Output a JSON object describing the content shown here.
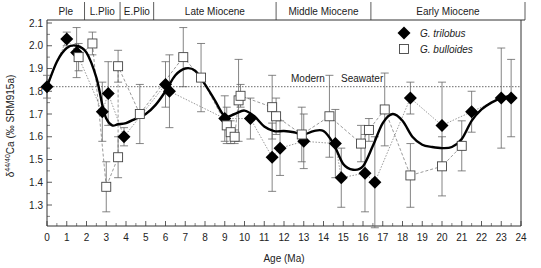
{
  "chart_data": {
    "type": "scatter",
    "title": "",
    "xlabel": "Age (Ma)",
    "ylabel": "δ44/40Ca (‰ SRM915a)",
    "ylabel_parts": {
      "delta": "δ",
      "sup": "44/40",
      "rest": "Ca (‰ SRM915a)"
    },
    "xlim": [
      0,
      24
    ],
    "ylim": [
      1.2,
      2.1
    ],
    "x_ticks": [
      0,
      1,
      2,
      3,
      4,
      5,
      6,
      7,
      8,
      9,
      10,
      11,
      12,
      13,
      14,
      15,
      16,
      17,
      18,
      19,
      20,
      21,
      22,
      23,
      24
    ],
    "y_ticks": [
      1.3,
      1.4,
      1.5,
      1.6,
      1.7,
      1.8,
      1.9,
      2.0,
      2.1
    ],
    "y_tick_labels": [
      "1.3",
      "1.4",
      "1.5",
      "1.6",
      "1.7",
      "1.8",
      "1.9",
      "2.0",
      "2.1"
    ],
    "grid": false,
    "legend_position": "upper right",
    "reference_line": {
      "y": 1.82,
      "label_parts": [
        "Modern",
        "Seawater"
      ],
      "style": "dotted"
    },
    "epochs": [
      {
        "label": "Ple",
        "start": 0,
        "end": 1.9
      },
      {
        "label": "L.Plio",
        "start": 1.9,
        "end": 3.7
      },
      {
        "label": "E.Plio",
        "start": 3.7,
        "end": 5.4
      },
      {
        "label": "Late Miocene",
        "start": 5.4,
        "end": 11.6
      },
      {
        "label": "Middle Miocene",
        "start": 11.6,
        "end": 16.4
      },
      {
        "label": "Early Miocene",
        "start": 16.4,
        "end": 24.2
      }
    ],
    "series": [
      {
        "name": "G. trilobus",
        "marker": "filled-diamond",
        "connector": "dotted",
        "points": [
          {
            "x": 0.0,
            "y": 1.82,
            "err": 0.05
          },
          {
            "x": 1.0,
            "y": 2.03,
            "err": 0.03
          },
          {
            "x": 1.5,
            "y": 1.97,
            "err": 0.11
          },
          {
            "x": 2.8,
            "y": 1.71,
            "err": 0.13
          },
          {
            "x": 3.1,
            "y": 1.79,
            "err": 0.14
          },
          {
            "x": 3.9,
            "y": 1.6,
            "err": 0.04
          },
          {
            "x": 6.0,
            "y": 1.83,
            "err": 0.1
          },
          {
            "x": 6.2,
            "y": 1.8,
            "err": 0.16
          },
          {
            "x": 9.0,
            "y": 1.68,
            "err": 0.1
          },
          {
            "x": 10.3,
            "y": 1.68,
            "err": 0.09
          },
          {
            "x": 11.4,
            "y": 1.51,
            "err": 0.15
          },
          {
            "x": 11.8,
            "y": 1.55,
            "err": 0.12
          },
          {
            "x": 13.0,
            "y": 1.58,
            "err": 0.12
          },
          {
            "x": 14.6,
            "y": 1.57,
            "err": 0.15
          },
          {
            "x": 14.9,
            "y": 1.42,
            "err": 0.13
          },
          {
            "x": 16.1,
            "y": 1.44,
            "err": 0.17
          },
          {
            "x": 16.6,
            "y": 1.4,
            "err": 0.2
          },
          {
            "x": 18.4,
            "y": 1.77,
            "err": 0.07
          },
          {
            "x": 20.0,
            "y": 1.65,
            "err": 0.19
          },
          {
            "x": 21.5,
            "y": 1.71,
            "err": 0.09
          },
          {
            "x": 23.0,
            "y": 1.77,
            "err": 0.22
          },
          {
            "x": 23.5,
            "y": 1.77,
            "err": 0.17
          }
        ]
      },
      {
        "name": "G. bulloides",
        "marker": "open-square",
        "connector": "dashed",
        "points": [
          {
            "x": 1.6,
            "y": 1.95,
            "err": 0.06
          },
          {
            "x": 2.3,
            "y": 2.01,
            "err": 0.05
          },
          {
            "x": 3.0,
            "y": 1.38,
            "err": 0.11
          },
          {
            "x": 3.6,
            "y": 1.51,
            "err": 0.09
          },
          {
            "x": 3.6,
            "y": 1.91,
            "err": 0.07
          },
          {
            "x": 4.7,
            "y": 1.7,
            "err": 0.13
          },
          {
            "x": 6.9,
            "y": 1.95,
            "err": 0.13
          },
          {
            "x": 7.8,
            "y": 1.86,
            "err": 0.15
          },
          {
            "x": 9.1,
            "y": 1.65,
            "err": 0.08
          },
          {
            "x": 9.3,
            "y": 1.62,
            "err": 0.05
          },
          {
            "x": 9.5,
            "y": 1.6,
            "err": 0.03
          },
          {
            "x": 9.7,
            "y": 1.76,
            "err": 0.18
          },
          {
            "x": 9.8,
            "y": 1.78,
            "err": 0.05
          },
          {
            "x": 11.4,
            "y": 1.73,
            "err": 0.14
          },
          {
            "x": 11.6,
            "y": 1.69,
            "err": 0.08
          },
          {
            "x": 12.9,
            "y": 1.61,
            "err": 0.12
          },
          {
            "x": 14.3,
            "y": 1.69,
            "err": 0.18
          },
          {
            "x": 15.9,
            "y": 1.57,
            "err": 0.08
          },
          {
            "x": 16.3,
            "y": 1.63,
            "err": 0.05
          },
          {
            "x": 17.1,
            "y": 1.72,
            "err": 0.16
          },
          {
            "x": 18.4,
            "y": 1.43,
            "err": 0.14
          },
          {
            "x": 20.0,
            "y": 1.47,
            "err": 0.13
          },
          {
            "x": 21.0,
            "y": 1.56,
            "err": 0.11
          }
        ]
      }
    ],
    "smooth_fit": {
      "name": "smoothed trend",
      "style": "thick solid black",
      "points": [
        [
          0.0,
          1.82
        ],
        [
          0.5,
          1.93
        ],
        [
          1.0,
          1.99
        ],
        [
          1.5,
          2.0
        ],
        [
          2.0,
          1.97
        ],
        [
          2.5,
          1.86
        ],
        [
          2.8,
          1.74
        ],
        [
          3.0,
          1.68
        ],
        [
          3.3,
          1.65
        ],
        [
          3.6,
          1.655
        ],
        [
          4.0,
          1.66
        ],
        [
          4.5,
          1.68
        ],
        [
          5.0,
          1.7
        ],
        [
          5.5,
          1.74
        ],
        [
          6.0,
          1.8
        ],
        [
          6.5,
          1.87
        ],
        [
          7.0,
          1.9
        ],
        [
          7.5,
          1.89
        ],
        [
          8.0,
          1.83
        ],
        [
          8.5,
          1.76
        ],
        [
          9.0,
          1.69
        ],
        [
          9.5,
          1.7
        ],
        [
          10.0,
          1.715
        ],
        [
          10.5,
          1.69
        ],
        [
          11.0,
          1.645
        ],
        [
          11.5,
          1.625
        ],
        [
          12.0,
          1.625
        ],
        [
          12.5,
          1.62
        ],
        [
          13.0,
          1.61
        ],
        [
          13.5,
          1.625
        ],
        [
          14.0,
          1.625
        ],
        [
          14.5,
          1.57
        ],
        [
          15.0,
          1.48
        ],
        [
          15.5,
          1.455
        ],
        [
          16.0,
          1.47
        ],
        [
          16.5,
          1.56
        ],
        [
          17.0,
          1.66
        ],
        [
          17.5,
          1.7
        ],
        [
          18.0,
          1.67
        ],
        [
          18.5,
          1.6
        ],
        [
          19.0,
          1.565
        ],
        [
          19.5,
          1.555
        ],
        [
          20.0,
          1.55
        ],
        [
          20.5,
          1.555
        ],
        [
          21.0,
          1.59
        ],
        [
          21.5,
          1.67
        ],
        [
          22.0,
          1.72
        ],
        [
          22.5,
          1.75
        ],
        [
          23.0,
          1.77
        ],
        [
          23.5,
          1.78
        ]
      ]
    }
  }
}
